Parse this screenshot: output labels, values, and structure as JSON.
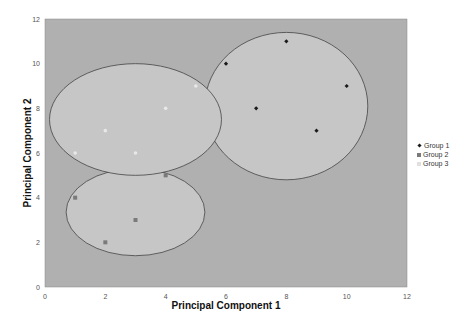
{
  "chart_data": {
    "type": "scatter",
    "title": "",
    "xlabel": "Principal Component 1",
    "ylabel": "Principal Component 2",
    "xlim": [
      0,
      12
    ],
    "ylim": [
      0,
      12
    ],
    "x_ticks": [
      0,
      2,
      4,
      6,
      8,
      10,
      12
    ],
    "y_ticks": [
      0,
      2,
      4,
      6,
      8,
      10,
      12
    ],
    "grid": false,
    "legend_position": "right",
    "series": [
      {
        "name": "Group 1",
        "color": "#1a1a1a",
        "marker": "diamond",
        "points": [
          [
            6,
            10
          ],
          [
            7,
            8
          ],
          [
            8,
            11
          ],
          [
            9,
            7
          ],
          [
            10,
            9
          ]
        ]
      },
      {
        "name": "Group 2",
        "color": "#7a7a7a",
        "marker": "square",
        "points": [
          [
            1,
            4
          ],
          [
            2,
            2
          ],
          [
            3,
            3
          ],
          [
            4,
            5
          ]
        ]
      },
      {
        "name": "Group 3",
        "color": "#e8e8e8",
        "marker": "triangle",
        "points": [
          [
            1,
            6
          ],
          [
            2,
            7
          ],
          [
            3,
            6
          ],
          [
            4,
            8
          ],
          [
            5,
            9
          ]
        ]
      }
    ],
    "annotations": [
      {
        "type": "ellipse",
        "group": "Group 1",
        "cx": 8.0,
        "cy": 8.1,
        "rx": 2.7,
        "ry": 3.3
      },
      {
        "type": "ellipse",
        "group": "Group 2",
        "cx": 3.0,
        "cy": 3.35,
        "rx": 2.3,
        "ry": 1.95
      },
      {
        "type": "ellipse",
        "group": "Group 3",
        "cx": 3.0,
        "cy": 7.5,
        "rx": 2.85,
        "ry": 2.5
      }
    ]
  },
  "legend": {
    "items": [
      "Group 1",
      "Group 2",
      "Group 3"
    ]
  },
  "axes": {
    "xlabel": "Principal Component 1",
    "ylabel": "Principal Component 2"
  }
}
